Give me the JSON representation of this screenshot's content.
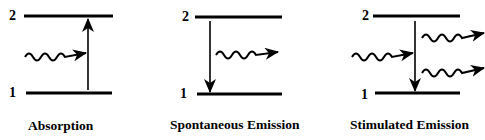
{
  "diagram": {
    "panels": [
      {
        "id": "absorption",
        "caption": "Absorption",
        "upper_level_label": "2",
        "lower_level_label": "1",
        "transition": "up",
        "incoming_photons": 1,
        "outgoing_photons": 0
      },
      {
        "id": "spontaneous-emission",
        "caption": "Spontaneous Emission",
        "upper_level_label": "2",
        "lower_level_label": "1",
        "transition": "down",
        "incoming_photons": 0,
        "outgoing_photons": 1
      },
      {
        "id": "stimulated-emission",
        "caption": "Stimulated Emission",
        "upper_level_label": "2",
        "lower_level_label": "1",
        "transition": "down",
        "incoming_photons": 1,
        "outgoing_photons": 2
      }
    ],
    "colors": {
      "line": "#000000",
      "background": "#ffffff"
    }
  }
}
